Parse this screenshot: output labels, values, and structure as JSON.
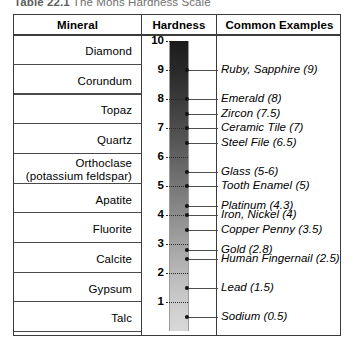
{
  "caption": {
    "prefix": "Table 22.1",
    "title": "The Mohs Hardness Scale"
  },
  "table": {
    "headers": {
      "mineral": "Mineral",
      "hardness": "Hardness",
      "examples": "Common Examples"
    },
    "minerals": [
      {
        "name": "Diamond",
        "sub": "",
        "hardness": 10
      },
      {
        "name": "Corundum",
        "sub": "",
        "hardness": 9
      },
      {
        "name": "Topaz",
        "sub": "",
        "hardness": 8
      },
      {
        "name": "Quartz",
        "sub": "",
        "hardness": 7
      },
      {
        "name": "Orthoclase",
        "sub": "(potassium feldspar)",
        "hardness": 6
      },
      {
        "name": "Apatite",
        "sub": "",
        "hardness": 5
      },
      {
        "name": "Fluorite",
        "sub": "",
        "hardness": 4
      },
      {
        "name": "Calcite",
        "sub": "",
        "hardness": 3
      },
      {
        "name": "Gypsum",
        "sub": "",
        "hardness": 2
      },
      {
        "name": "Talc",
        "sub": "",
        "hardness": 1
      }
    ],
    "scale_ticks": [
      "10",
      "9",
      "8",
      "7",
      "6",
      "5",
      "4",
      "3",
      "2",
      "1"
    ],
    "examples": [
      {
        "label": "Ruby, Sapphire (9)",
        "value": 9
      },
      {
        "label": "Emerald (8)",
        "value": 8
      },
      {
        "label": "Zircon (7.5)",
        "value": 7.5
      },
      {
        "label": "Ceramic Tile (7)",
        "value": 7
      },
      {
        "label": "Steel File (6.5)",
        "value": 6.5
      },
      {
        "label": "Glass (5-6)",
        "value": 5.5
      },
      {
        "label": "Tooth Enamel (5)",
        "value": 5
      },
      {
        "label": "Platinum (4.3)",
        "value": 4.3
      },
      {
        "label": "Iron, Nickel (4)",
        "value": 4
      },
      {
        "label": "Copper Penny (3.5)",
        "value": 3.5
      },
      {
        "label": "Gold (2.8)",
        "value": 2.8
      },
      {
        "label": "Human Fingernail (2.5)",
        "value": 2.5
      },
      {
        "label": "Lead (1.5)",
        "value": 1.5
      },
      {
        "label": "Sodium (0.5)",
        "value": 0.5
      }
    ]
  },
  "chart_data": {
    "type": "bar",
    "title": "The Mohs Hardness Scale",
    "xlabel": "",
    "ylabel": "Hardness",
    "ylim": [
      0,
      10
    ],
    "grid": false,
    "legend": "none",
    "categories": [
      "Talc",
      "Gypsum",
      "Calcite",
      "Fluorite",
      "Apatite",
      "Orthoclase (potassium feldspar)",
      "Quartz",
      "Topaz",
      "Corundum",
      "Diamond"
    ],
    "values": [
      1,
      2,
      3,
      4,
      5,
      6,
      7,
      8,
      9,
      10
    ],
    "annotations": [
      {
        "label": "Ruby, Sapphire (9)",
        "value": 9
      },
      {
        "label": "Emerald (8)",
        "value": 8
      },
      {
        "label": "Zircon (7.5)",
        "value": 7.5
      },
      {
        "label": "Ceramic Tile (7)",
        "value": 7
      },
      {
        "label": "Steel File (6.5)",
        "value": 6.5
      },
      {
        "label": "Glass (5-6)",
        "value": 5.5
      },
      {
        "label": "Tooth Enamel (5)",
        "value": 5
      },
      {
        "label": "Platinum (4.3)",
        "value": 4.3
      },
      {
        "label": "Iron, Nickel (4)",
        "value": 4
      },
      {
        "label": "Copper Penny (3.5)",
        "value": 3.5
      },
      {
        "label": "Gold (2.8)",
        "value": 2.8
      },
      {
        "label": "Human Fingernail (2.5)",
        "value": 2.5
      },
      {
        "label": "Lead (1.5)",
        "value": 1.5
      },
      {
        "label": "Sodium (0.5)",
        "value": 0.5
      }
    ]
  },
  "colors": {
    "border": "#3b3b3b",
    "bar_top": "#1b1b1b",
    "bar_bottom": "#d8d8d8",
    "leader": "#4f4f4f",
    "caption": "#6f6f6f"
  }
}
